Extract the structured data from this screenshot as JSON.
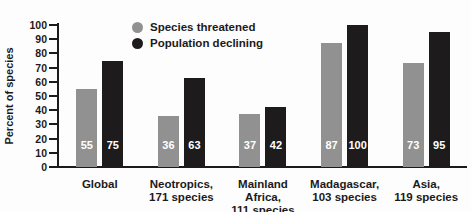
{
  "chart_data": {
    "type": "bar",
    "title": "",
    "ylabel": "Percent of species",
    "xlabel": "",
    "ylim": [
      0,
      100
    ],
    "yticks": [
      0,
      10,
      20,
      30,
      40,
      50,
      60,
      70,
      80,
      90,
      100
    ],
    "grid": false,
    "legend_position": "top-center",
    "categories": [
      {
        "lines": [
          "Global"
        ]
      },
      {
        "lines": [
          "Neotropics,",
          "171 species"
        ]
      },
      {
        "lines": [
          "Mainland Africa,",
          "111 species"
        ]
      },
      {
        "lines": [
          "Madagascar,",
          "103 species"
        ]
      },
      {
        "lines": [
          "Asia,",
          "119 species"
        ]
      }
    ],
    "series": [
      {
        "name": "Species threatened",
        "color": "#919191",
        "values": [
          55,
          36,
          37,
          87,
          73
        ]
      },
      {
        "name": "Population declining",
        "color": "#1d1b1b",
        "values": [
          75,
          63,
          42,
          100,
          95
        ]
      }
    ],
    "value_labels_shown": true,
    "value_label_color": "#ffffff"
  },
  "colors": {
    "background": "#fdfdfd",
    "axis": "#1c1a1a",
    "text": "#1c1a1a"
  }
}
